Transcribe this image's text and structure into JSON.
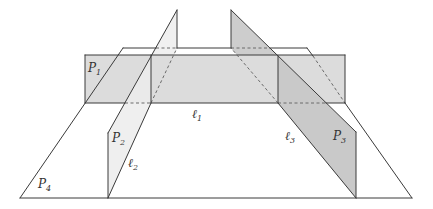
{
  "diagram": {
    "colors": {
      "p4_fill": "#ffffff",
      "p1_fill": "#dcdcdc",
      "p2_fill": "#eeeeee",
      "p3_fill": "#cbcbcb",
      "edge": "#3a3a3a"
    },
    "labels": {
      "p1": {
        "symbol": "P",
        "sub": "1"
      },
      "p2": {
        "symbol": "P",
        "sub": "2"
      },
      "p3": {
        "symbol": "P",
        "sub": "3"
      },
      "p4": {
        "symbol": "P",
        "sub": "4"
      },
      "l1": {
        "symbol": "ℓ",
        "sub": "1"
      },
      "l2": {
        "symbol": "ℓ",
        "sub": "2"
      },
      "l3": {
        "symbol": "ℓ",
        "sub": "3"
      }
    }
  }
}
